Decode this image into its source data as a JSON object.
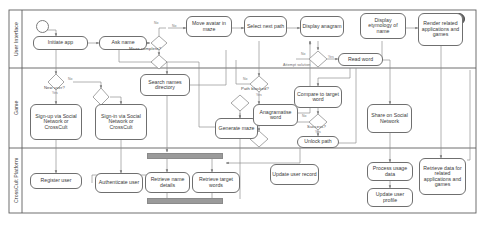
{
  "diagram": {
    "stroke_color": "#6f6f6f",
    "label_color": "#7a7a7a",
    "sync_bar_color": "#9a9a9a"
  },
  "lanes": [
    {
      "id": "ui",
      "label": "User Interface"
    },
    {
      "id": "game",
      "label": "Game"
    },
    {
      "id": "platform",
      "label": "CrossCult Platform"
    }
  ],
  "nodes": {
    "start": {
      "type": "start",
      "label": ""
    },
    "end": {
      "type": "end",
      "label": ""
    },
    "initiate_app": {
      "label": "Initiate app"
    },
    "ask_name": {
      "label": "Ask name"
    },
    "move_avatar": {
      "label": "Move avatar in maze"
    },
    "select_next_path": {
      "label": "Select next path"
    },
    "display_anagram": {
      "label": "Display anagram"
    },
    "read_word": {
      "label": "Read word"
    },
    "display_etymology": {
      "label": "Display etymology of name"
    },
    "render_related": {
      "label": "Render related applications and games"
    },
    "signup": {
      "label": "Sign-up via Social Network or CrossCult"
    },
    "signin": {
      "label": "Sign-in via Social Network or CrossCult"
    },
    "search_names": {
      "label": "Search names directory"
    },
    "generate_maze": {
      "label": "Generate maze"
    },
    "anagramatise_word": {
      "label": "Anagramatise word"
    },
    "compare_target": {
      "label": "Compare to target word"
    },
    "unlock_path": {
      "label": "Unlock path"
    },
    "share_social": {
      "label": "Share on Social Network"
    },
    "register_user": {
      "label": "Register user"
    },
    "authenticate_user": {
      "label": "Authenticate user"
    },
    "retrieve_name_details": {
      "label": "Retrieve name details"
    },
    "retrieve_target_words": {
      "label": "Retrieve target words"
    },
    "update_user_record": {
      "label": "Update user record"
    },
    "process_usage_data": {
      "label": "Process usage data"
    },
    "update_user_profile": {
      "label": "Update user profile"
    },
    "retrieve_related_data": {
      "label": "Retrieve data for related applications and games"
    }
  },
  "decisions": {
    "maze_complete": {
      "label": "Maze complete?"
    },
    "maze_complete_2": {
      "label": ""
    },
    "new_user": {
      "label": "New user?"
    },
    "new_user_2": {
      "label": ""
    },
    "attempt_solution": {
      "label": "Attempt solution"
    },
    "path_blocked": {
      "label": "Path blocked?"
    },
    "success": {
      "label": "Success?"
    },
    "anagram_join": {
      "label": ""
    },
    "maze_join": {
      "label": ""
    }
  },
  "edge_labels": {
    "no_maze_top": "No",
    "no_maze_side": "No",
    "no_new_user": "No",
    "yes_new_user": "Yes",
    "no_attempt": "No",
    "yes_attempt": "Yes",
    "no_path_blocked": "No",
    "yes_path_blocked": "Yes",
    "no_success": "No",
    "yes_success": "Yes"
  }
}
